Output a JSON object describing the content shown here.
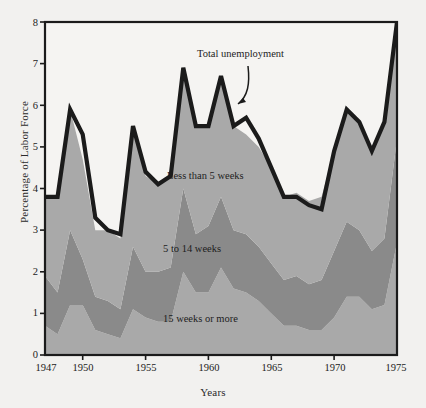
{
  "figure": {
    "background_color": "#f2f1ef",
    "plot_background_color": "#f5f4f2",
    "frame_color": "#1b1b1b"
  },
  "axes": {
    "y_title": "Percentage of Labor Force",
    "x_title": "Years",
    "y_ticks": [
      "0",
      "1",
      "2",
      "3",
      "4",
      "5",
      "6",
      "7",
      "8"
    ],
    "x_ticks": [
      "1947",
      "1950",
      "1955",
      "1960",
      "1965",
      "1970",
      "1975"
    ]
  },
  "labels": {
    "total": "Total unemployment",
    "short": "Less than 5 weeks",
    "mid": "5 to 14 weeks",
    "long": "15 weeks or more"
  },
  "chart_data": {
    "type": "area",
    "stacked": true,
    "title": "",
    "xlabel": "Years",
    "ylabel": "Percentage of Labor Force",
    "xlim": [
      1947,
      1975
    ],
    "ylim": [
      0,
      8
    ],
    "grid": false,
    "legend": "in-plot annotations",
    "annotation": {
      "text": "Total unemployment",
      "points_to_year": 1958,
      "points_to_value": 6.9
    },
    "series_colors": {
      "15 weeks or more": "#a9a9a9",
      "5 to 14 weeks": "#8a8a8a",
      "Less than 5 weeks": "#a9a9a9",
      "Total unemployment line": "#1b1b1b"
    },
    "x": [
      1947,
      1948,
      1949,
      1950,
      1951,
      1952,
      1953,
      1954,
      1955,
      1956,
      1957,
      1958,
      1959,
      1960,
      1961,
      1962,
      1963,
      1964,
      1965,
      1966,
      1967,
      1968,
      1969,
      1970,
      1971,
      1972,
      1973,
      1974,
      1975
    ],
    "series": [
      {
        "name": "15 weeks or more",
        "values": [
          0.7,
          0.5,
          1.2,
          1.2,
          0.6,
          0.5,
          0.4,
          1.1,
          0.9,
          0.8,
          0.8,
          2.0,
          1.5,
          1.5,
          2.1,
          1.6,
          1.5,
          1.3,
          1.0,
          0.7,
          0.7,
          0.6,
          0.6,
          0.9,
          1.4,
          1.4,
          1.1,
          1.2,
          2.7
        ]
      },
      {
        "name": "5 to 14 weeks",
        "values": [
          1.2,
          1.0,
          1.8,
          1.1,
          0.8,
          0.8,
          0.7,
          1.5,
          1.1,
          1.2,
          1.3,
          2.0,
          1.4,
          1.6,
          1.7,
          1.4,
          1.4,
          1.3,
          1.2,
          1.1,
          1.2,
          1.1,
          1.2,
          1.6,
          1.8,
          1.6,
          1.4,
          1.6,
          2.5
        ]
      },
      {
        "name": "Less than 5 weeks",
        "values": [
          1.9,
          2.3,
          2.9,
          2.4,
          1.6,
          1.7,
          1.7,
          2.9,
          2.3,
          2.1,
          2.2,
          2.9,
          2.6,
          2.4,
          2.9,
          2.5,
          2.4,
          2.4,
          2.3,
          2.0,
          2.0,
          2.0,
          2.0,
          2.4,
          2.7,
          2.6,
          2.4,
          2.8,
          2.8
        ]
      }
    ],
    "total_unemployment": [
      3.8,
      3.8,
      5.9,
      5.3,
      3.3,
      3.0,
      2.9,
      5.5,
      4.4,
      4.1,
      4.3,
      6.9,
      5.5,
      5.5,
      6.7,
      5.5,
      5.7,
      5.2,
      4.5,
      3.8,
      3.8,
      3.6,
      3.5,
      4.9,
      5.9,
      5.6,
      4.9,
      5.6,
      8.0
    ]
  }
}
